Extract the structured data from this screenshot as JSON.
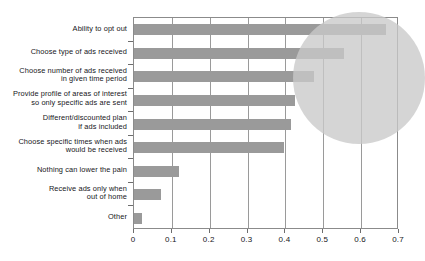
{
  "chart_data": {
    "type": "bar",
    "orientation": "horizontal",
    "title": "",
    "xlabel": "",
    "ylabel": "",
    "xlim": [
      0,
      0.7
    ],
    "grid": true,
    "legend": false,
    "xticks": [
      "0",
      "0.1",
      "0.2",
      "0.3",
      "0.4",
      "0.5",
      "0.6",
      "0.7"
    ],
    "xtick_values": [
      0,
      0.1,
      0.2,
      0.3,
      0.4,
      0.5,
      0.6,
      0.7
    ],
    "categories": [
      "Ability to opt out",
      "Choose type of ads received",
      "Choose number of ads received\nin given time period",
      "Provide profile of areas of interest\nso only specific ads are sent",
      "Different/discounted plan\nif ads included",
      "Choose specific times when ads\nwould be received",
      "Nothing can lower the pain",
      "Receive ads only when\nout of home",
      "Other"
    ],
    "category_lines": [
      [
        "Ability to opt out"
      ],
      [
        "Choose type of ads received"
      ],
      [
        "Choose number of ads received",
        "in given time period"
      ],
      [
        "Provide profile of areas of interest",
        "so only specific ads are sent"
      ],
      [
        "Different/discounted plan",
        "if ads included"
      ],
      [
        "Choose specific times when ads",
        "would be received"
      ],
      [
        "Nothing can lower the pain"
      ],
      [
        "Receive ads only when",
        "out of home"
      ],
      [
        "Other"
      ]
    ],
    "values": [
      0.665,
      0.555,
      0.475,
      0.425,
      0.415,
      0.395,
      0.12,
      0.07,
      0.02
    ],
    "bar_color": "#9a9a9a",
    "annotations": [
      {
        "type": "ellipse-highlight",
        "label": "highlight-circle",
        "color": "#c9c9c9",
        "covers_categories": [
          "Ability to opt out",
          "Choose type of ads received",
          "Choose number of ads received in given time period",
          "Provide profile of areas of interest so only specific ads are sent",
          "Different/discounted plan if ads included",
          "Choose specific times when ads would be received"
        ]
      }
    ]
  }
}
